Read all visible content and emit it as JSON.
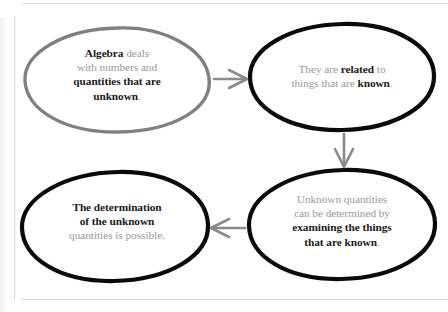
{
  "document": {
    "type": "cycle-diagram",
    "background_color": "#ffffff"
  },
  "diagram": {
    "accent_gray": "#808080",
    "accent_black": "#000000",
    "text_gray": "#9a9a9a",
    "text_black": "#1a1a1a",
    "nodes": [
      {
        "id": "node-1",
        "position": "top-left",
        "outline_color": "#808080",
        "segments": [
          {
            "text": "Algebra",
            "emphasis": "bold"
          },
          {
            "text": " deals",
            "emphasis": "normal"
          },
          {
            "text": "with numbers and",
            "emphasis": "normal"
          },
          {
            "text": "quantities that are",
            "emphasis": "bold"
          },
          {
            "text": "unknown",
            "emphasis": "bold"
          },
          {
            "text": ".",
            "emphasis": "normal"
          }
        ],
        "plain_text": "Algebra deals with numbers and quantities that are unknown."
      },
      {
        "id": "node-2",
        "position": "top-right",
        "outline_color": "#000000",
        "segments": [
          {
            "text": "They are ",
            "emphasis": "normal"
          },
          {
            "text": "related",
            "emphasis": "bold"
          },
          {
            "text": " to",
            "emphasis": "normal"
          },
          {
            "text": "things that are ",
            "emphasis": "normal"
          },
          {
            "text": "known",
            "emphasis": "bold"
          },
          {
            "text": ".",
            "emphasis": "normal"
          }
        ],
        "plain_text": "They are related to things that are known."
      },
      {
        "id": "node-3",
        "position": "bottom-right",
        "outline_color": "#000000",
        "segments": [
          {
            "text": "Unknown quantities",
            "emphasis": "normal"
          },
          {
            "text": "can be determined by",
            "emphasis": "normal"
          },
          {
            "text": "examining the things",
            "emphasis": "bold"
          },
          {
            "text": "that are known",
            "emphasis": "bold"
          },
          {
            "text": ".",
            "emphasis": "normal"
          }
        ],
        "plain_text": "Unknown quantities can be determined by examining the things that are known."
      },
      {
        "id": "node-4",
        "position": "bottom-left",
        "outline_color": "#000000",
        "segments": [
          {
            "text": "The determination",
            "emphasis": "bold"
          },
          {
            "text": "of the unknown",
            "emphasis": "bold"
          },
          {
            "text": "quantities is possible.",
            "emphasis": "normal"
          }
        ],
        "plain_text": "The determination of the unknown quantities is possible."
      }
    ],
    "arrows": [
      {
        "id": "arrow-1",
        "from": "node-1",
        "to": "node-2",
        "direction": "right",
        "color": "#8a8a8a"
      },
      {
        "id": "arrow-2",
        "from": "node-2",
        "to": "node-3",
        "direction": "down",
        "color": "#8a8a8a"
      },
      {
        "id": "arrow-3",
        "from": "node-3",
        "to": "node-4",
        "direction": "left",
        "color": "#8a8a8a"
      }
    ]
  }
}
